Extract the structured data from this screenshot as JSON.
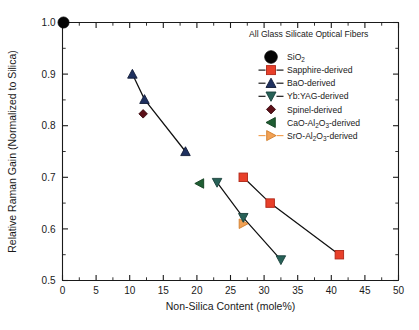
{
  "chart_data": {
    "type": "scatter",
    "title": "",
    "xlabel": "Non-Silica Content (mole%)",
    "ylabel": "Relative Raman Gain (Normalized to Silica)",
    "xlim": [
      0,
      50
    ],
    "ylim": [
      0.5,
      1.0
    ],
    "xticks": [
      0,
      5,
      10,
      15,
      20,
      25,
      30,
      35,
      40,
      45,
      50
    ],
    "xticklabels": [
      "0",
      "5",
      "10",
      "15",
      "20",
      "25",
      "30",
      "35",
      "40",
      "45",
      "50"
    ],
    "yticks": [
      0.5,
      0.6,
      0.7,
      0.8,
      0.9,
      1.0
    ],
    "yticklabels": [
      "0.5",
      "0.6",
      "0.7",
      "0.8",
      "0.9",
      "1.0"
    ],
    "xtick_minor_step": 2.5,
    "ytick_minor_step": 0.05,
    "grid": false,
    "legend_position": "top-right",
    "legend_title": "All Glass Silicate Optical Fibers",
    "series": [
      {
        "name": "SiO2",
        "legend_label": "SiO",
        "legend_sub": "2",
        "marker": "circle",
        "color": "#050505",
        "edge": "#050505",
        "marker_size": 11,
        "connected": false,
        "legend_line": false,
        "points": [
          {
            "x": 0.15,
            "y": 1.0
          }
        ]
      },
      {
        "name": "Sapphire-derived",
        "legend_label": "Sapphire-derived",
        "marker": "square",
        "color": "#E8402A",
        "edge": "#B02718",
        "marker_size": 8.5,
        "connected": true,
        "legend_line": true,
        "points": [
          {
            "x": 26.9,
            "y": 0.7
          },
          {
            "x": 30.9,
            "y": 0.65
          },
          {
            "x": 41.2,
            "y": 0.55
          }
        ]
      },
      {
        "name": "BaO-derived",
        "legend_label": "BaO-derived",
        "marker": "triangle-up",
        "color": "#1F3160",
        "edge": "#121C38",
        "marker_size": 9.5,
        "connected": true,
        "legend_line": true,
        "points": [
          {
            "x": 10.4,
            "y": 0.9
          },
          {
            "x": 12.2,
            "y": 0.851
          },
          {
            "x": 18.3,
            "y": 0.75
          }
        ]
      },
      {
        "name": "Yb:YAG-derived",
        "legend_label": "Yb:YAG-derived",
        "marker": "triangle-down",
        "color": "#276157",
        "edge": "#19403A",
        "marker_size": 9.5,
        "connected": true,
        "legend_line": true,
        "points": [
          {
            "x": 23.0,
            "y": 0.69
          },
          {
            "x": 26.9,
            "y": 0.622
          },
          {
            "x": 32.5,
            "y": 0.54
          }
        ]
      },
      {
        "name": "Spinel-derived",
        "legend_label": "Spinel-derived",
        "marker": "diamond",
        "color": "#5C1018",
        "edge": "#3A0A10",
        "marker_size": 8.5,
        "connected": false,
        "legend_line": false,
        "points": [
          {
            "x": 12.0,
            "y": 0.823
          }
        ]
      },
      {
        "name": "CaO-Al2O3-derived",
        "legend_label_parts": [
          "CaO-Al",
          "2",
          "O",
          "3",
          "-derived"
        ],
        "marker": "triangle-left",
        "color": "#1F5E33",
        "edge": "#12401F",
        "marker_size": 9.5,
        "connected": false,
        "legend_line": false,
        "points": [
          {
            "x": 20.4,
            "y": 0.688
          }
        ]
      },
      {
        "name": "SrO-Al2O3-derived",
        "legend_label_parts": [
          "SrO-Al",
          "2",
          "O",
          "3",
          "-derived"
        ],
        "marker": "triangle-right",
        "color": "#F2A154",
        "edge": "#D07E2C",
        "marker_size": 9.5,
        "connected": false,
        "legend_line": true,
        "legend_line_color": "#F2A154",
        "points": [
          {
            "x": 26.9,
            "y": 0.61
          }
        ]
      }
    ]
  }
}
